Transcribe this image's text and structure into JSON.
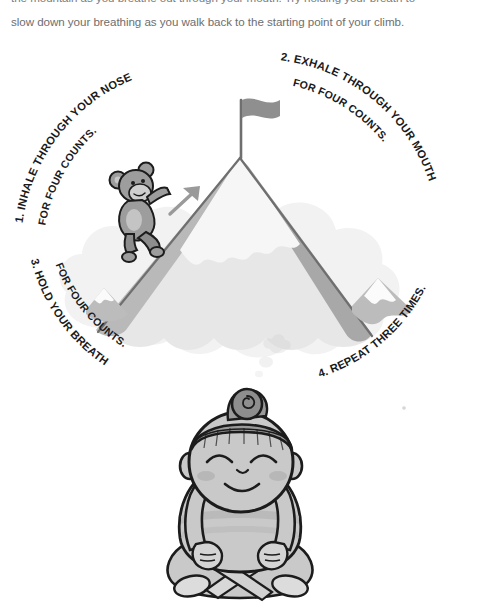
{
  "body_text": {
    "line1": "the mountain as you breathe out through your mouth. Try holding your breath to",
    "line2": "slow down your breathing as you walk back to the starting point of your climb."
  },
  "illustration": {
    "title": "mountain-breathing-exercise",
    "steps": [
      {
        "id": "step-1",
        "number": "1.",
        "line1": "1. INHALE THROUGH YOUR NOSE",
        "line2": "FOR FOUR COUNTS."
      },
      {
        "id": "step-2",
        "number": "2.",
        "line1": "2. EXHALE THROUGH YOUR MOUTH",
        "line2": "FOR FOUR COUNTS."
      },
      {
        "id": "step-3",
        "number": "3.",
        "line1": "3. HOLD YOUR BREATH",
        "line2": "FOR FOUR COUNTS."
      },
      {
        "id": "step-4",
        "number": "4.",
        "line1": "4. REPEAT THREE TIMES.",
        "line2": ""
      }
    ],
    "scene_elements": {
      "flag": "summit-flag",
      "climber": "monkey-climber",
      "arrow": "up-right-arrow",
      "mountain": "snow-capped-mountain",
      "small_peak_left": "small-peak-left",
      "small_peak_right": "small-peak-right",
      "cloud_base": "cloud-base",
      "meditator": "seated-meditating-child",
      "thought_puffs": "thought-puffs"
    },
    "colors": {
      "text": "#1a1a1a",
      "body_text": "#6d6e70",
      "outline": "#1c1c1c",
      "mountain_light": "#e9e9e9",
      "mountain_mid": "#bdbdbd",
      "mountain_dark": "#9a9a9a",
      "cloud": "#f1f1f1",
      "skin": "#c9c9c9",
      "skin_light": "#d9d9d9",
      "hair": "#8e8e8e",
      "background": "#ffffff"
    }
  }
}
